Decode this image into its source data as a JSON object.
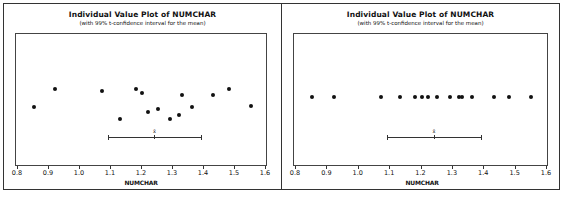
{
  "chart_data": [
    {
      "type": "scatter",
      "variant": "individual-value-plot-jittered",
      "title": "Individual Value Plot of NUMCHAR",
      "subtitle": "(with 99% t-confidence interval for the mean)",
      "xlabel": "NUMCHAR",
      "ylabel": "",
      "xlim": [
        0.8,
        1.6
      ],
      "x_ticks": [
        "0.8",
        "0.9",
        "1.0",
        "1.1",
        "1.2",
        "1.3",
        "1.4",
        "1.5",
        "1.6"
      ],
      "grid": false,
      "jitter": true,
      "values": [
        0.85,
        0.92,
        1.07,
        1.13,
        1.18,
        1.2,
        1.22,
        1.25,
        1.29,
        1.32,
        1.33,
        1.36,
        1.43,
        1.48,
        1.55
      ],
      "jitter_y_px": [
        73,
        55,
        57,
        85,
        55,
        59,
        78,
        75,
        85,
        81,
        61,
        73,
        61,
        55,
        72
      ],
      "mean_label": "x̄",
      "mean": 1.24,
      "confidence_interval": [
        1.09,
        1.39
      ],
      "confidence_level": "99%"
    },
    {
      "type": "scatter",
      "variant": "individual-value-plot",
      "title": "Individual Value Plot of NUMCHAR",
      "subtitle": "(with 99% t-confidence interval for the mean)",
      "xlabel": "NUMCHAR",
      "ylabel": "",
      "xlim": [
        0.8,
        1.6
      ],
      "x_ticks": [
        "0.8",
        "0.9",
        "1.0",
        "1.1",
        "1.2",
        "1.3",
        "1.4",
        "1.5",
        "1.6"
      ],
      "grid": false,
      "jitter": false,
      "values": [
        0.85,
        0.92,
        1.07,
        1.13,
        1.18,
        1.2,
        1.22,
        1.25,
        1.29,
        1.32,
        1.33,
        1.36,
        1.43,
        1.48,
        1.55
      ],
      "mean_label": "x̄",
      "mean": 1.24,
      "confidence_interval": [
        1.09,
        1.39
      ],
      "confidence_level": "99%"
    }
  ]
}
